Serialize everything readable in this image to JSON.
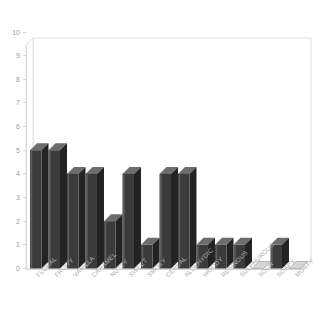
{
  "chart_data": {
    "type": "bar",
    "title": "",
    "subtitle": "",
    "xlabel": "",
    "ylabel": "",
    "ylim": [
      0,
      10
    ],
    "ytick_labels": [
      "0",
      "1",
      "2",
      "3",
      "4",
      "5",
      "6",
      "7",
      "8",
      "9",
      "10"
    ],
    "ytick_values": [
      0,
      1,
      2,
      3,
      4,
      5,
      6,
      7,
      8,
      9,
      10
    ],
    "grid": false,
    "legend": false,
    "legend_position": "none",
    "style": "3d-bars",
    "bar_color": "#3b3b3b",
    "bar_top_color": "#6d6d6d",
    "bar_side_color": "#232323",
    "axis_color": "#d8d8d8",
    "label_color": "#b0b0b0",
    "background_color": "#ffffff",
    "category_label_rotation": -45,
    "categories": [
      "FLORAL",
      "FRUITY",
      "VANILLA",
      "CARAMEL",
      "NUTTY",
      "SWEET",
      "SMOKY",
      "CEREAL",
      "ALDEHYDIC",
      "WOODY",
      "RESINOUS",
      "SULPHUROUS",
      "SOUR",
      "SOAPY",
      "MUSTY"
    ],
    "values": [
      5,
      5,
      4,
      4,
      2,
      4,
      1,
      4,
      4,
      1,
      1,
      1,
      0,
      1,
      0
    ]
  }
}
